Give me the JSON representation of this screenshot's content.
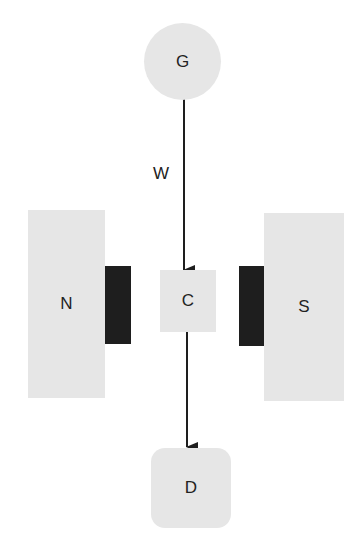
{
  "diagram": {
    "nodes": {
      "generator": {
        "label": "G"
      },
      "north": {
        "label": "N"
      },
      "center": {
        "label": "C"
      },
      "south": {
        "label": "S"
      },
      "detector": {
        "label": "D"
      }
    },
    "edges": [
      {
        "from": "G",
        "to": "C",
        "label": "W"
      },
      {
        "from": "C",
        "to": "D",
        "label": ""
      }
    ],
    "edge_label_w": "W",
    "colors": {
      "node_fill": "#e6e6e6",
      "pole_face": "#1e1e1e",
      "arrow": "#1e1e1e",
      "text": "#222222"
    }
  }
}
